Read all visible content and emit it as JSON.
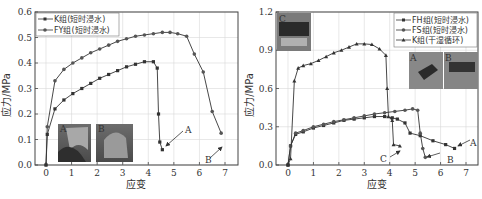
{
  "chart_data": [
    {
      "type": "line",
      "title": "",
      "xlabel": "应变",
      "ylabel": "应力/MPa",
      "xlim": [
        -0.3,
        7.3
      ],
      "ylim": [
        0,
        0.6
      ],
      "xticks": [
        "0",
        "1",
        "2",
        "3",
        "4",
        "5",
        "6",
        "7"
      ],
      "yticks": [
        "0.0",
        "0.1",
        "0.2",
        "0.3",
        "0.4",
        "0.5",
        "0.6"
      ],
      "grid": true,
      "legend_position": "upper-left",
      "series": [
        {
          "name": "K组(短时浸水)",
          "marker": "square",
          "x": [
            0,
            0.05,
            0.35,
            0.7,
            1.05,
            1.4,
            1.75,
            2.1,
            2.45,
            2.8,
            3.15,
            3.5,
            3.85,
            4.2,
            4.35,
            4.4,
            4.45,
            4.55
          ],
          "y": [
            0,
            0.12,
            0.22,
            0.255,
            0.28,
            0.3,
            0.32,
            0.34,
            0.355,
            0.37,
            0.385,
            0.395,
            0.405,
            0.405,
            0.38,
            0.2,
            0.09,
            0.06
          ]
        },
        {
          "name": "FY组(短时浸水)",
          "marker": "circle",
          "x": [
            0,
            0.05,
            0.35,
            0.7,
            1.05,
            1.4,
            1.75,
            2.1,
            2.45,
            2.8,
            3.15,
            3.5,
            3.85,
            4.2,
            4.55,
            4.85,
            5.15,
            5.5,
            5.8,
            6.15,
            6.5,
            6.85
          ],
          "y": [
            0,
            0.15,
            0.33,
            0.375,
            0.4,
            0.42,
            0.44,
            0.455,
            0.47,
            0.485,
            0.495,
            0.505,
            0.51,
            0.515,
            0.52,
            0.52,
            0.515,
            0.505,
            0.435,
            0.365,
            0.21,
            0.125
          ]
        }
      ],
      "annotations": [
        {
          "text": "A",
          "x": 4.55,
          "y": 0.09,
          "arrow": true
        },
        {
          "text": "B",
          "x": 6.85,
          "y": 0.08,
          "arrow": true
        }
      ],
      "insets": [
        {
          "label": "A"
        },
        {
          "label": "B"
        }
      ]
    },
    {
      "type": "line",
      "title": "",
      "xlabel": "应变",
      "ylabel": "应力/MPa",
      "xlim": [
        -0.3,
        7.3
      ],
      "ylim": [
        0,
        1.2
      ],
      "xticks": [
        "0",
        "1",
        "2",
        "3",
        "4",
        "5",
        "6",
        "7"
      ],
      "yticks": [
        "0.0",
        "0.3",
        "0.6",
        "0.9",
        "1.2"
      ],
      "grid": true,
      "legend_position": "upper-right",
      "series": [
        {
          "name": "FH组(短时浸水)",
          "marker": "square",
          "x": [
            0,
            0.1,
            0.3,
            0.6,
            1.0,
            1.4,
            1.8,
            2.2,
            2.6,
            3.0,
            3.4,
            3.8,
            4.1,
            4.3,
            4.6,
            4.8,
            5.2,
            5.7,
            6.2,
            6.55
          ],
          "y": [
            0,
            0.15,
            0.24,
            0.26,
            0.29,
            0.31,
            0.33,
            0.35,
            0.36,
            0.37,
            0.38,
            0.38,
            0.37,
            0.36,
            0.33,
            0.25,
            0.23,
            0.19,
            0.16,
            0.13
          ]
        },
        {
          "name": "FS组(短时浸水)",
          "marker": "circle",
          "x": [
            0,
            0.1,
            0.3,
            0.6,
            1.0,
            1.4,
            1.8,
            2.2,
            2.6,
            3.0,
            3.4,
            3.8,
            4.2,
            4.6,
            4.9,
            5.1,
            5.2,
            5.3,
            5.4
          ],
          "y": [
            0,
            0.15,
            0.25,
            0.27,
            0.3,
            0.32,
            0.34,
            0.355,
            0.37,
            0.385,
            0.4,
            0.41,
            0.42,
            0.43,
            0.44,
            0.43,
            0.25,
            0.13,
            0.06
          ]
        },
        {
          "name": "K组(干湿循环)",
          "marker": "triangle",
          "x": [
            0,
            0.1,
            0.25,
            0.4,
            0.6,
            0.9,
            1.2,
            1.5,
            1.8,
            2.1,
            2.4,
            2.7,
            3.0,
            3.3,
            3.6,
            3.85,
            3.9,
            3.95,
            4.1,
            4.15,
            4.4
          ],
          "y": [
            0,
            0.05,
            0.66,
            0.76,
            0.78,
            0.795,
            0.82,
            0.85,
            0.88,
            0.9,
            0.925,
            0.95,
            0.95,
            0.945,
            0.91,
            0.86,
            0.6,
            0.38,
            0.35,
            0.16,
            0.15
          ]
        }
      ],
      "annotations": [
        {
          "text": "A",
          "x": 6.55,
          "y": 0.13,
          "arrow": true
        },
        {
          "text": "B",
          "x": 5.4,
          "y": 0.06,
          "arrow": true
        },
        {
          "text": "C",
          "x": 4.4,
          "y": 0.12,
          "arrow": true
        }
      ],
      "insets": [
        {
          "label": "C"
        },
        {
          "label": "A"
        },
        {
          "label": "B"
        }
      ]
    }
  ],
  "left_chart": {
    "ylabel": "应力/MPa",
    "xlabel": "应变",
    "legend": [
      "K组(短时浸水)",
      "FY组(短时浸水)"
    ],
    "yticks": [
      "0.0",
      "0.1",
      "0.2",
      "0.3",
      "0.4",
      "0.5",
      "0.6"
    ],
    "xticks": [
      "0",
      "1",
      "2",
      "3",
      "4",
      "5",
      "6",
      "7"
    ],
    "annotations": {
      "a": "A",
      "b": "B"
    },
    "insets": {
      "a": "A",
      "b": "B"
    }
  },
  "right_chart": {
    "ylabel": "应力/MPa",
    "xlabel": "应变",
    "legend": [
      "FH组(短时浸水)",
      "FS组(短时浸水)",
      "K组(干湿循环)"
    ],
    "yticks": [
      "0.0",
      "0.3",
      "0.6",
      "0.9",
      "1.2"
    ],
    "xticks": [
      "0",
      "1",
      "2",
      "3",
      "4",
      "5",
      "6",
      "7"
    ],
    "annotations": {
      "a": "A",
      "b": "B",
      "c": "C"
    },
    "insets": {
      "a": "A",
      "b": "B",
      "c": "C"
    }
  },
  "colors": {
    "line": "#333333",
    "grid": "#d8d8d8",
    "axis": "#444444"
  }
}
